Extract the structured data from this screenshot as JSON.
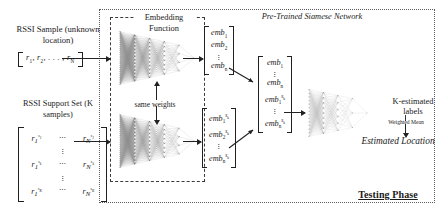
{
  "diagram": {
    "title": "Testing Phase",
    "regions": {
      "testing_phase_label": "Testing Phase",
      "embedding_function_title": "Embedding Function",
      "siamese_title": "Pre-Trained Siamese Network"
    },
    "inputs": {
      "sample_title": "RSSI Sample (unknown location)",
      "sample_vector": [
        "r₁,",
        "r₂,",
        ". . . ,",
        "rₙ"
      ],
      "support_title": "RSSI Support Set (K samples)",
      "support_matrix_rows": [
        [
          "r₁",
          "⋯",
          "rₙ"
        ],
        [
          "r₁",
          "⋯",
          "rₙ"
        ],
        [
          "r₁",
          "⋯",
          "rₙ"
        ]
      ]
    },
    "annotations": {
      "same_weights": "same weights",
      "weighted_mean": "Weighted Mean",
      "k_estimated_labels": "K-estimated labels",
      "estimated_location": "Estimated Location"
    },
    "embeddings": {
      "top_vector": [
        "emb",
        "emb",
        "⋮",
        "emb"
      ],
      "top_subs": [
        "1",
        "2",
        "",
        "n"
      ],
      "bottom_vector": [
        "emb",
        "emb",
        "⋮",
        "emb"
      ],
      "bottom_subs": [
        "1",
        "2",
        "",
        "n"
      ],
      "bottom_sups": [
        "sₖ",
        "sₖ",
        "",
        "sₖ"
      ],
      "mid_vector": [
        "emb",
        "⋮",
        "emb",
        "emb",
        "⋮",
        "emb"
      ],
      "mid_subs": [
        "1",
        "",
        "n",
        "1",
        "",
        "n"
      ],
      "mid_sups": [
        "",
        "",
        "",
        "sₖ",
        "",
        "sₖ"
      ]
    },
    "colors": {
      "ink": "#1a1a1a",
      "dashed_border": "#3a3a3a",
      "dotted_border": "#5a5a5a",
      "net_stroke": "#9a9a9a"
    }
  }
}
